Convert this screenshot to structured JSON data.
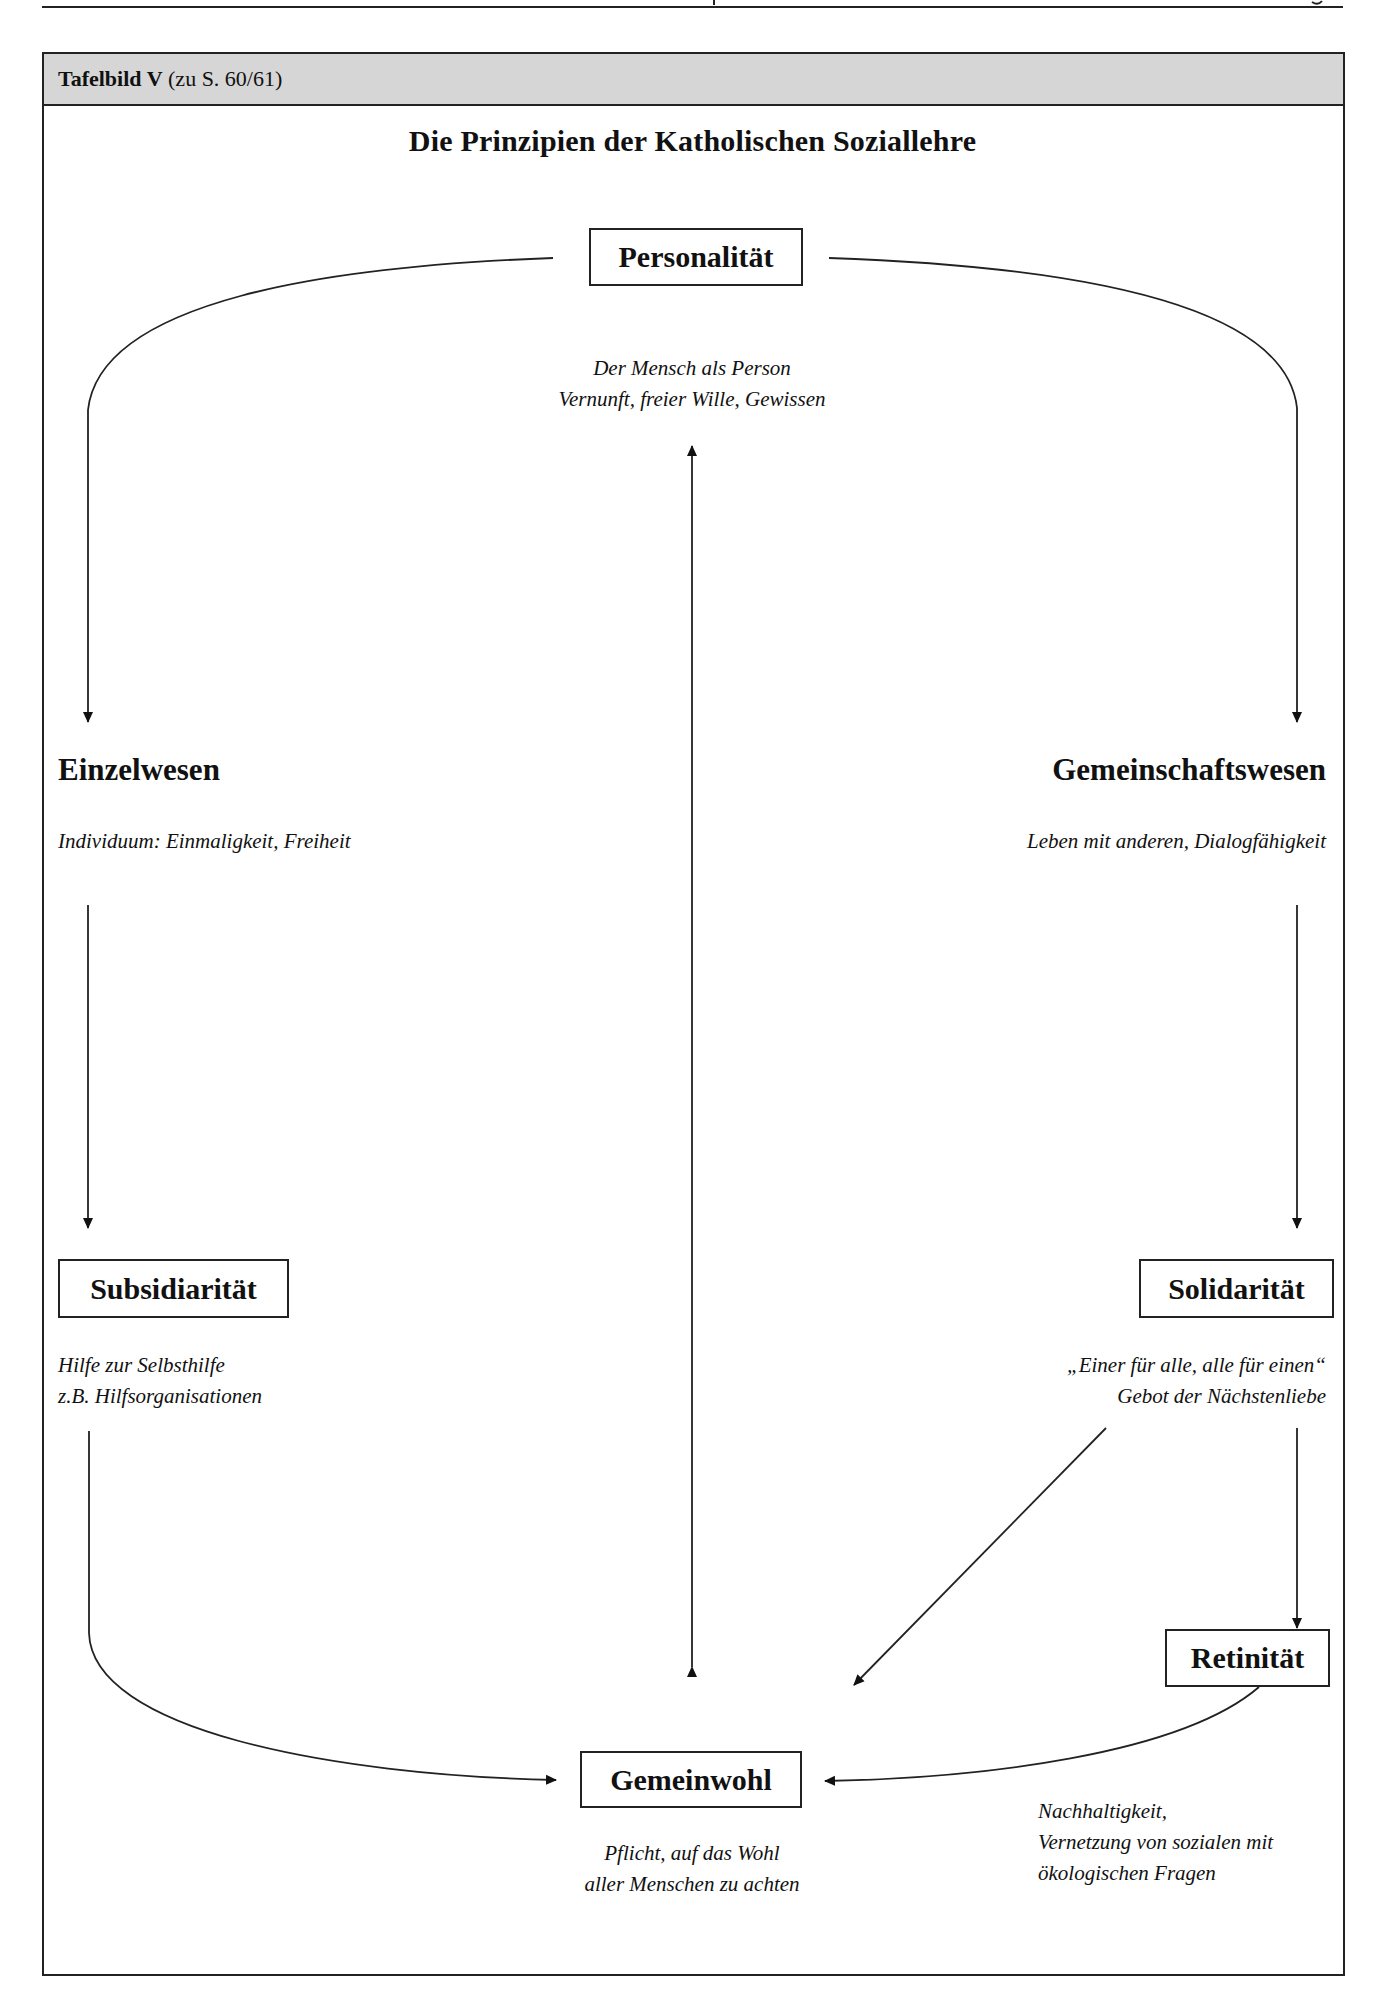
{
  "header": {
    "label_bold": "Tafelbild V",
    "label_regular": " (zu S. 60/61)",
    "background_color": "#d6d6d6"
  },
  "diagram": {
    "title": "Die Prinzipien der Katholischen Soziallehre",
    "nodes": {
      "personalitaet": {
        "label": "Personalität",
        "desc_lines": [
          "Der Mensch als Person",
          "Vernunft, freier Wille, Gewissen"
        ]
      },
      "einzelwesen": {
        "label": "Einzelwesen",
        "desc_lines": [
          "Individuum: Einmaligkeit, Freiheit"
        ]
      },
      "gemeinschaftswesen": {
        "label": "Gemeinschaftswesen",
        "desc_lines": [
          "Leben mit anderen, Dialogfähigkeit"
        ]
      },
      "subsidiaritaet": {
        "label": "Subsidiarität",
        "desc_lines": [
          "Hilfe zur Selbsthilfe",
          "z.B. Hilfsorganisationen"
        ]
      },
      "solidaritaet": {
        "label": "Solidarität",
        "desc_lines": [
          "„Einer für alle, alle für einen“",
          "Gebot der Nächstenliebe"
        ]
      },
      "retinitaet": {
        "label": "Retinität",
        "desc_lines": [
          "Nachhaltigkeit,",
          "Vernetzung von sozialen mit",
          "ökologischen Fragen"
        ]
      },
      "gemeinwohl": {
        "label": "Gemeinwohl",
        "desc_lines": [
          "Pflicht, auf das Wohl",
          "aller Menschen zu achten"
        ]
      }
    },
    "edges": [
      {
        "from": "Personalität",
        "to": "Einzelwesen",
        "style": "curved-arrow"
      },
      {
        "from": "Personalität",
        "to": "Gemeinschaftswesen",
        "style": "curved-arrow"
      },
      {
        "from": "Personalität",
        "to": "Gemeinwohl",
        "style": "double-arrow"
      },
      {
        "from": "Einzelwesen",
        "to": "Subsidiarität",
        "style": "arrow"
      },
      {
        "from": "Gemeinschaftswesen",
        "to": "Solidarität",
        "style": "arrow"
      },
      {
        "from": "Subsidiarität",
        "to": "Gemeinwohl",
        "style": "curved-arrow"
      },
      {
        "from": "Solidarität",
        "to": "Gemeinwohl",
        "style": "diagonal-arrow"
      },
      {
        "from": "Solidarität",
        "to": "Retinität",
        "style": "arrow"
      },
      {
        "from": "Retinität",
        "to": "Gemeinwohl",
        "style": "curved-arrow"
      }
    ]
  }
}
